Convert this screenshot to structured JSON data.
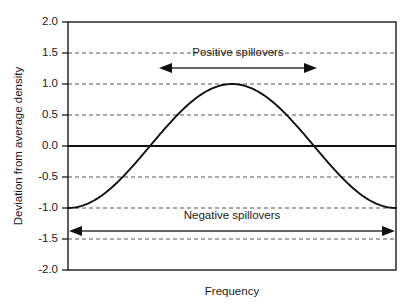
{
  "chart_data": {
    "type": "line",
    "title": "",
    "xlabel": "Frequency",
    "ylabel": "Deviation from average density",
    "ylim": [
      -2.0,
      2.0
    ],
    "xlim": [
      0,
      1
    ],
    "grid": true,
    "legend": "none",
    "y_ticks": [
      "2.0",
      "1.5",
      "1.0",
      "0.5",
      "0.0",
      "-0.5",
      "-1.0",
      "-1.5",
      "-2.0"
    ],
    "y_tick_values": [
      2.0,
      1.5,
      1.0,
      0.5,
      0.0,
      -0.5,
      -1.0,
      -1.5,
      -2.0
    ],
    "x_ticks": [],
    "zero_line": 0.0,
    "series": [
      {
        "name": "Deviation from average density",
        "description": "negative cosine wave, one full cycle: starts at 0, trough at -1.0, peak at +1.0, trough at -1.0, ends at 0",
        "x": [
          0.0,
          0.05,
          0.1,
          0.15,
          0.2,
          0.25,
          0.3,
          0.35,
          0.4,
          0.45,
          0.5,
          0.55,
          0.6,
          0.65,
          0.7,
          0.75,
          0.8,
          0.85,
          0.9,
          0.95,
          1.0
        ],
        "values": [
          0.0,
          -0.31,
          -0.59,
          -0.81,
          -0.95,
          -1.0,
          -0.95,
          -0.81,
          -0.59,
          -0.31,
          0.0,
          0.31,
          0.59,
          0.81,
          0.95,
          1.0,
          0.95,
          0.81,
          0.59,
          0.31,
          0.0
        ]
      }
    ],
    "annotations": [
      {
        "id": "positive-spillovers",
        "label": "Positive spillovers",
        "arrow": "double",
        "y_value": 1.6,
        "x_start": 0.28,
        "x_end": 0.76
      },
      {
        "id": "negative-spillovers",
        "label": "Negative spillovers",
        "arrow": "double",
        "y_value": -1.35,
        "x_start": 0.0,
        "x_end": 1.0
      }
    ]
  },
  "colors": {
    "curve": "#111111",
    "gridline": "#555555",
    "zero_line": "#111111",
    "frame": "#1a1a1a",
    "arrow": "#333333",
    "background": "#ffffff",
    "text": "#1a1a1a"
  }
}
